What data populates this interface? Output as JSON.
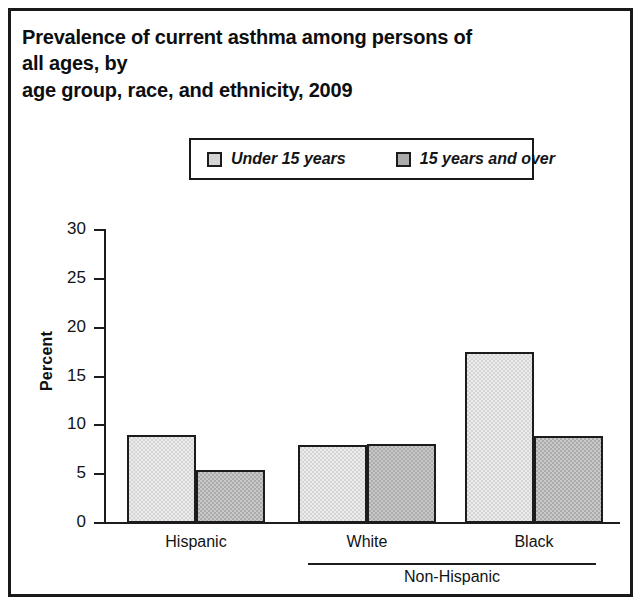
{
  "figure": {
    "title": "Prevalence of current asthma among persons of all ages, by\nage group, race, and ethnicity, 2009"
  },
  "legend": {
    "entries": [
      {
        "label": "Under 15 years",
        "swatch_color": "#d5d5d5"
      },
      {
        "label": "15 years and over",
        "swatch_color": "#ababab"
      }
    ]
  },
  "axes": {
    "ylabel": "Percent",
    "yticks": [
      "0",
      "5",
      "10",
      "15",
      "20",
      "25",
      "30"
    ],
    "group_label": "Non-Hispanic"
  },
  "chart_data": {
    "type": "bar",
    "title": "Prevalence of current asthma among persons of all ages, by age group, race, and ethnicity, 2009",
    "xlabel": "",
    "ylabel": "Percent",
    "ylim": [
      0,
      30
    ],
    "yticks": [
      0,
      5,
      10,
      15,
      20,
      25,
      30
    ],
    "grid": false,
    "legend_position": "top-center",
    "categories": [
      "Hispanic",
      "White",
      "Black"
    ],
    "category_group": {
      "label": "Non-Hispanic",
      "members": [
        "White",
        "Black"
      ]
    },
    "series": [
      {
        "name": "Under 15 years",
        "color": "#d5d5d5",
        "values": [
          9.0,
          8.0,
          17.5
        ]
      },
      {
        "name": "15 years and over",
        "color": "#ababab",
        "values": [
          5.4,
          8.1,
          8.9
        ]
      }
    ]
  }
}
